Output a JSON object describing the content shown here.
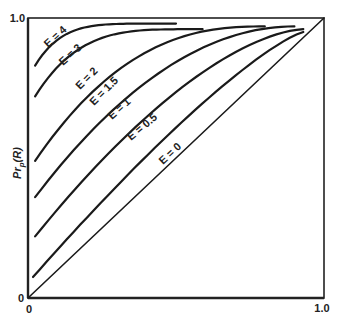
{
  "chart_data": {
    "type": "line",
    "title": "",
    "xlabel": "",
    "ylabel": "Pr_p(R)",
    "ylabel_main": "Pr",
    "ylabel_sub": "p",
    "ylabel_tail": "(R)",
    "xlim": [
      0,
      1.0
    ],
    "ylim": [
      0,
      1.0
    ],
    "x_ticks": [
      "0",
      "1.0"
    ],
    "y_ticks": [
      "0",
      "1.0"
    ],
    "grid": false,
    "legend": "inline labels along curves",
    "series": [
      {
        "name": "E = 4",
        "label": "E = 4",
        "x_start": 0.024,
        "y_start": 0.83,
        "x_end": 0.5,
        "y_end": 0.98,
        "label_pos": [
          48,
          48
        ],
        "label_rot": -42
      },
      {
        "name": "E = 3",
        "label": "E = 3",
        "x_start": 0.024,
        "y_start": 0.72,
        "x_end": 0.59,
        "y_end": 0.96,
        "label_pos": [
          63,
          66
        ],
        "label_rot": -42
      },
      {
        "name": "E = 2",
        "label": "E = 2",
        "x_start": 0.024,
        "y_start": 0.49,
        "x_end": 0.8,
        "y_end": 0.97,
        "label_pos": [
          80,
          90
        ],
        "label_rot": -45
      },
      {
        "name": "E = 1.5",
        "label": "E = 1.5",
        "x_start": 0.024,
        "y_start": 0.36,
        "x_end": 0.9,
        "y_end": 0.97,
        "label_pos": [
          94,
          106
        ],
        "label_rot": -45
      },
      {
        "name": "E = 1",
        "label": "E = 1",
        "x_start": 0.024,
        "y_start": 0.22,
        "x_end": 0.93,
        "y_end": 0.96,
        "label_pos": [
          112,
          120
        ],
        "label_rot": -42
      },
      {
        "name": "E = 0.5",
        "label": "E = 0.5",
        "x_start": 0.017,
        "y_start": 0.075,
        "x_end": 0.93,
        "y_end": 0.95,
        "label_pos": [
          131,
          141
        ],
        "label_rot": -40
      },
      {
        "name": "E = 0",
        "label": "E = 0",
        "x_start": 0.0,
        "y_start": 0.0,
        "x_end": 1.0,
        "y_end": 1.0,
        "label_pos": [
          163,
          165
        ],
        "label_rot": -43
      }
    ],
    "curve_exponents": [
      5.5,
      4.0,
      2.5,
      2.0,
      1.6,
      1.25,
      1.0
    ]
  },
  "axes": {
    "y_top_tick": "1.0",
    "y_bottom_tick": "0",
    "x_left_tick": "0",
    "x_right_tick": "1.0"
  }
}
